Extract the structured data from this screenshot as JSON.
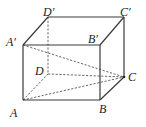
{
  "figure": {
    "type": "cuboid",
    "vertices": {
      "A": {
        "label": "A",
        "x": 23,
        "y": 100
      },
      "B": {
        "label": "B",
        "x": 100,
        "y": 100
      },
      "C": {
        "label": "C",
        "x": 124,
        "y": 77
      },
      "D": {
        "label": "D",
        "x": 48,
        "y": 74
      },
      "A1": {
        "label": "A′",
        "x": 23,
        "y": 45
      },
      "B1": {
        "label": "B′",
        "x": 100,
        "y": 45
      },
      "C1": {
        "label": "C′",
        "x": 124,
        "y": 17
      },
      "D1": {
        "label": "D′",
        "x": 48,
        "y": 17
      }
    },
    "solid_edges": [
      [
        "A1",
        "B1"
      ],
      [
        "B1",
        "C1"
      ],
      [
        "C1",
        "D1"
      ],
      [
        "D1",
        "A1"
      ],
      [
        "A1",
        "A"
      ],
      [
        "B1",
        "B"
      ],
      [
        "C1",
        "C"
      ],
      [
        "A",
        "B"
      ],
      [
        "B",
        "C"
      ]
    ],
    "dashed_edges": [
      [
        "D1",
        "D"
      ],
      [
        "A",
        "D"
      ],
      [
        "D",
        "C"
      ],
      [
        "A1",
        "C"
      ],
      [
        "A",
        "C"
      ]
    ],
    "points": [
      "C"
    ],
    "labels": {
      "A": "A",
      "B": "B",
      "C": "C",
      "D": "D",
      "A1": "A′",
      "B1": "B′",
      "C1": "C′",
      "D1": "D′"
    }
  }
}
